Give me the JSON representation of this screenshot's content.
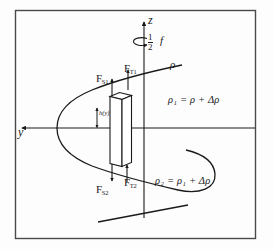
{
  "figure": {
    "frame": {
      "border_color": "#4a4a4a",
      "background": "#fdfdfd"
    },
    "ink_color": "#1a1a1a",
    "axes": {
      "vertical_label": "z",
      "horizontal_label": "y"
    },
    "rotation": {
      "coefficient_numerator": "1",
      "coefficient_denominator": "2",
      "symbol": "f"
    },
    "density_labels": {
      "base": "ρ",
      "upper": "ρ₁ = ρ + Δρ",
      "lower": "ρ₂ = ρ₁ + Δρ"
    },
    "height_label": "h(y)",
    "forces": [
      {
        "name": "force-s1",
        "label": "F",
        "subscript": "S1",
        "direction": "up"
      },
      {
        "name": "force-t1",
        "label": "F",
        "subscript": "T1",
        "direction": "up"
      },
      {
        "name": "force-s2",
        "label": "F",
        "subscript": "S2",
        "direction": "down"
      },
      {
        "name": "force-t2",
        "label": "F",
        "subscript": "T2",
        "direction": "up"
      }
    ]
  }
}
